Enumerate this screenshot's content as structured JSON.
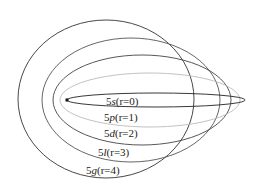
{
  "diagram": {
    "nucleus": {
      "cx": 67,
      "cy": 100,
      "size": 3,
      "color": "#111111"
    },
    "orbits": [
      {
        "id": "5g",
        "label": "5g(r=4)",
        "n_part": "5",
        "l_part": "g",
        "r_part": "(r=4)",
        "cx": 106,
        "cy": 99,
        "rx": 88,
        "ry": 79,
        "stroke": "#333333",
        "label_x": 86,
        "label_y": 174
      },
      {
        "id": "5l",
        "label": "5l(r=3)",
        "n_part": "5",
        "l_part": "l",
        "r_part": "(r=3)",
        "cx": 131,
        "cy": 100,
        "rx": 89,
        "ry": 62,
        "stroke": "#555555",
        "label_x": 98,
        "label_y": 156
      },
      {
        "id": "5d",
        "label": "5d(r=2)",
        "n_part": "5",
        "l_part": "d",
        "r_part": "(r=2)",
        "cx": 142,
        "cy": 100,
        "rx": 89,
        "ry": 45,
        "stroke": "#444444",
        "label_x": 104,
        "label_y": 137
      },
      {
        "id": "5p",
        "label": "5p(r=1)",
        "n_part": "5",
        "l_part": "p",
        "r_part": "(r=1)",
        "cx": 150,
        "cy": 100,
        "rx": 90,
        "ry": 27,
        "stroke": "#bbbbbb",
        "label_x": 104,
        "label_y": 121
      },
      {
        "id": "5s",
        "label": "5s(r=0)",
        "n_part": "5",
        "l_part": "s",
        "r_part": "(r=0)",
        "cx": 156,
        "cy": 100,
        "rx": 89,
        "ry": 7,
        "stroke": "#222222",
        "label_x": 106,
        "label_y": 105
      }
    ]
  }
}
